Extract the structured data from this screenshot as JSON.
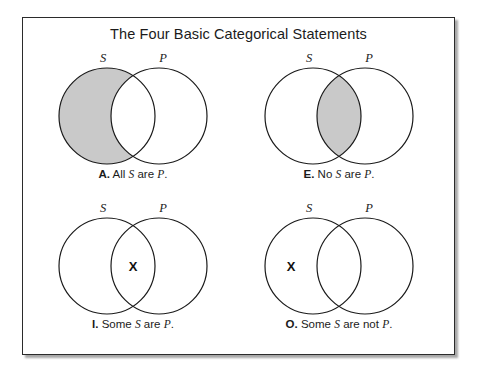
{
  "figure": {
    "title": "The Four Basic Categorical Statements",
    "border_color": "#2b2b2b",
    "background_color": "#ffffff",
    "shade_color": "#c9c9c9",
    "stroke_color": "#1a1a1a"
  },
  "panels": [
    {
      "id": "A",
      "tag": "A.",
      "left_label": "S",
      "right_label": "P",
      "caption_prefix": "All ",
      "caption_mid": " are ",
      "caption_suffix": ".",
      "caption_full": "A. All S are P.",
      "shading": "left-only",
      "x_marker": null
    },
    {
      "id": "E",
      "tag": "E.",
      "left_label": "S",
      "right_label": "P",
      "caption_prefix": "No ",
      "caption_mid": " are ",
      "caption_suffix": ".",
      "caption_full": "E. No S are P.",
      "shading": "intersection",
      "x_marker": null
    },
    {
      "id": "I",
      "tag": "I.",
      "left_label": "S",
      "right_label": "P",
      "caption_prefix": "Some ",
      "caption_mid": " are ",
      "caption_suffix": ".",
      "caption_full": "I. Some S are P.",
      "shading": "none",
      "x_marker": "intersection"
    },
    {
      "id": "O",
      "tag": "O.",
      "left_label": "S",
      "right_label": "P",
      "caption_prefix": "Some ",
      "caption_mid": " are not ",
      "caption_suffix": ".",
      "caption_full": "O. Some S are not P.",
      "shading": "none",
      "x_marker": "left-only"
    }
  ],
  "marker": {
    "glyph": "X"
  }
}
